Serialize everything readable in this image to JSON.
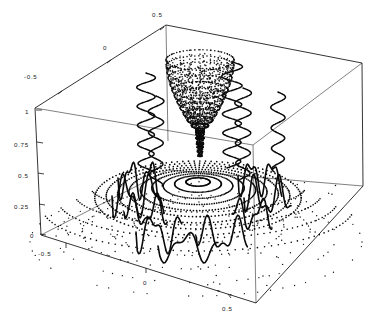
{
  "figure": {
    "title": "",
    "background": "#ffffff",
    "ink": "#0a0a0a",
    "width": 382,
    "height": 322
  },
  "chart_data": {
    "type": "scatter",
    "title": "",
    "subtitle": "",
    "plot_style": "3d-surface-point-plot",
    "projection": "isometric-box",
    "xlabel": "",
    "ylabel": "",
    "zlabel": "",
    "grid": false,
    "legend": null,
    "legend_position": "none",
    "axes": [
      {
        "name": "x-axis",
        "position": "bottom-front-left-edge",
        "ticks": [
          -0.5,
          0
        ],
        "tick_labels": [
          "-0.5",
          "0"
        ],
        "range": [
          -0.75,
          0.75
        ]
      },
      {
        "name": "y-axis",
        "position": "bottom-front-right-edge",
        "ticks": [
          0.5
        ],
        "tick_labels": [
          "0.5"
        ],
        "range": [
          -0.75,
          0.75
        ]
      },
      {
        "name": "x-axis-top",
        "position": "top-back-left-edge",
        "ticks": [
          -0.5,
          0,
          0.5
        ],
        "tick_labels": [
          "-0.5",
          "0",
          "0.5"
        ],
        "range": [
          -0.75,
          0.75
        ]
      },
      {
        "name": "z-axis",
        "position": "left-vertical-edge",
        "ticks": [
          0,
          0.25,
          0.5,
          0.75,
          1
        ],
        "tick_labels": [
          "0",
          "0.25",
          "0.5",
          "0.75",
          "1"
        ],
        "range": [
          0,
          1
        ]
      }
    ],
    "features": [
      {
        "name": "central-blob",
        "description": "dense dotted egg-shaped lobe centered above origin",
        "center_x": 0.0,
        "center_y": 0.0,
        "z_top": 1.0,
        "z_bottom": 0.52,
        "point_count": 720
      },
      {
        "name": "contour-rings",
        "description": "concentric dotted elliptical rings on mid plane",
        "ring_count": 9,
        "z_level": 0.5
      },
      {
        "name": "helix-curves",
        "description": "vertical sinusoidal oscillating curves",
        "count": 5
      },
      {
        "name": "base-scatter",
        "description": "sparse scattered points on bottom plane",
        "z_level": 0.0,
        "point_count": 180
      }
    ],
    "tick_values_all": [
      "-0.5",
      "0",
      "0.5",
      "0",
      "0.25",
      "0.5",
      "0.75",
      "1"
    ]
  },
  "tick_labels": {
    "top_left_edge": [
      "-0.5",
      "0",
      "0.5"
    ],
    "z_axis": [
      "1",
      "0.75",
      "0.5",
      "0.25",
      "0"
    ],
    "bottom_left_edge": [
      "-0.5",
      "0"
    ],
    "bottom_right_edge": [
      "0.5"
    ]
  },
  "labels": {
    "t_neg05_topleft": "-0.5",
    "t_0_topleft": "0",
    "t_05_top": "0.5",
    "t_z1": "1",
    "t_z075": "0.75",
    "t_z05": "0.5",
    "t_z025": "0.25",
    "t_z0": "0",
    "t_neg05_bottomleft": "-0.5",
    "t_0_bottom": "0",
    "t_05_bottomright": "0.5"
  }
}
